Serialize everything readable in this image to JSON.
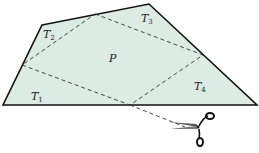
{
  "diagram": {
    "fill_color": "#dcebe4",
    "stroke_color": "#111111",
    "dash_color": "#333333",
    "quadrilateral": [
      [
        42,
        25
      ],
      [
        149,
        4
      ],
      [
        257,
        105
      ],
      [
        3,
        105
      ]
    ],
    "midpoints": [
      [
        95,
        14
      ],
      [
        203,
        55
      ],
      [
        130,
        105
      ],
      [
        22,
        65
      ]
    ],
    "labels": {
      "T1": {
        "base": "T",
        "sub": "1",
        "x": 31,
        "y": 100
      },
      "T2": {
        "base": "T",
        "sub": "2",
        "x": 43,
        "y": 38
      },
      "T3": {
        "base": "T",
        "sub": "3",
        "x": 141,
        "y": 22
      },
      "T4": {
        "base": "T",
        "sub": "4",
        "x": 194,
        "y": 90
      },
      "P": {
        "base": "P",
        "x": 109,
        "y": 62
      }
    },
    "cut_line_end": [
      190,
      128
    ],
    "scissors_icon": "scissors-icon"
  }
}
